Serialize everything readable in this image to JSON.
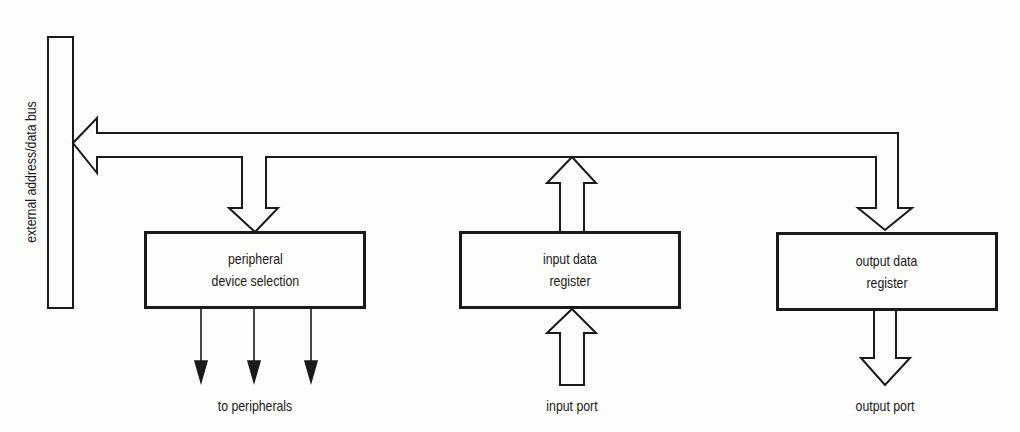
{
  "diagram": {
    "bus_label": "external address/data bus",
    "blocks": [
      {
        "id": "peripheral-device-selection",
        "lines": [
          "peripheral",
          "device selection"
        ]
      },
      {
        "id": "input-data-register",
        "lines": [
          "input data",
          "register"
        ]
      },
      {
        "id": "output-data-register",
        "lines": [
          "output data",
          "register"
        ]
      }
    ],
    "outputs": {
      "peripherals": "to peripherals",
      "input_port": "input port",
      "output_port": "output port"
    },
    "stroke_color": "#1a1a1a",
    "background_color": "#fdfdfb"
  }
}
